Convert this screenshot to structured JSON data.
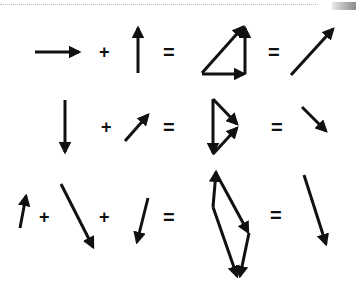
{
  "diagram": {
    "operators": {
      "plus": "+",
      "equals": "="
    },
    "colors": {
      "ink": "#111111",
      "background": "#ffffff",
      "rule": "#b8b8b8"
    },
    "rows": [
      {
        "id": "row-1",
        "description": "right arrow + up arrow = right triangle (tip-to-tail) = diagonal up-right arrow",
        "terms": [
          "rightward vector",
          "upward vector"
        ],
        "construction": "right-triangle",
        "result": "up-right vector"
      },
      {
        "id": "row-2",
        "description": "down arrow + up-right arrow = triangle construction = down-right arrow",
        "terms": [
          "downward vector",
          "up-right vector"
        ],
        "construction": "triangle",
        "result": "down-right vector"
      },
      {
        "id": "row-3",
        "description": "short up arrow + long down-right arrow + down-left arrow = polygon construction = long down-right arrow",
        "terms": [
          "short upward vector",
          "long down-right vector",
          "down-left vector"
        ],
        "construction": "polygon",
        "result": "long down-right vector"
      }
    ]
  }
}
